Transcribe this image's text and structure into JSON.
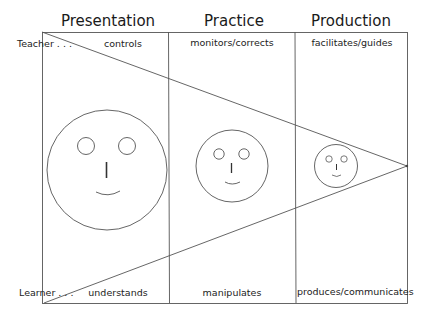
{
  "columns": [
    {
      "title": "Presentation",
      "teacher_role": "controls",
      "learner_role": "understands"
    },
    {
      "title": "Practice",
      "teacher_role": "monitors/corrects",
      "learner_role": "manipulates"
    },
    {
      "title": "Production",
      "teacher_role": "facilitates/guides",
      "learner_role": "produces/communicates"
    }
  ],
  "rows": {
    "teacher_label": "Teacher . . .",
    "learner_label": "Learner . . ."
  },
  "faces": [
    {
      "stage": "Presentation",
      "size": "large"
    },
    {
      "stage": "Practice",
      "size": "medium"
    },
    {
      "stage": "Production",
      "size": "small"
    }
  ],
  "colors": {
    "line": "#555555",
    "text": "#222222",
    "background": "#ffffff"
  }
}
